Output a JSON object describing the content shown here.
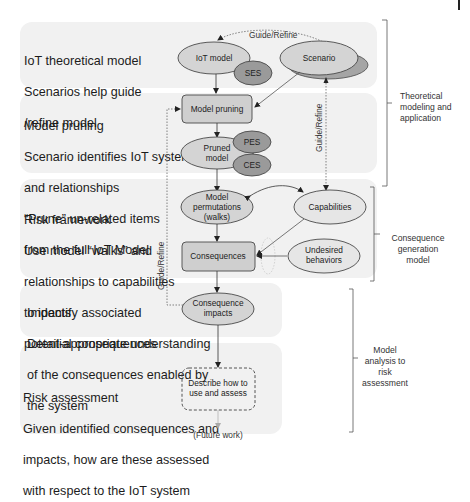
{
  "bands": [
    {
      "id": "theoretical",
      "lines": [
        "IoT theoretical model",
        "Scenarios help guide",
        "/refine model"
      ]
    },
    {
      "id": "pruning",
      "lines": [
        "Model pruning",
        "Scenario identifies IoT system",
        "and relationships",
        "“Prune” un-related items",
        "from the full IoT Model"
      ]
    },
    {
      "id": "risk-framework",
      "lines": [
        "Risk framework",
        "Use model “walks” and",
        "relationships to capabilities",
        "to identify associated",
        "potential consequences"
      ]
    },
    {
      "id": "impacts",
      "lines": [
        "Impacts",
        "Detail-appropriate understanding",
        "of the consequences enabled by",
        "the system"
      ]
    },
    {
      "id": "risk-assessment",
      "lines": [
        "Risk assessment",
        "Given identified consequences and",
        "impacts, how are these assessed",
        "with respect to the IoT system"
      ]
    }
  ],
  "nodes": {
    "iot_model": "IoT model",
    "ses": "SES",
    "scenario": "Scenario",
    "model_pruning": "Model pruning",
    "pruned_model": [
      "Pruned",
      "model"
    ],
    "pes": "PES",
    "ces": "CES",
    "model_permutations": [
      "Model",
      "permutations",
      "(walks)"
    ],
    "capabilities": "Capabilities",
    "consequences": "Consequences",
    "undesired_behaviors": [
      "Undesired",
      "behaviors"
    ],
    "consequence_impacts": [
      "Consequence",
      "impacts"
    ],
    "describe": [
      "Describe how to",
      "use and assess"
    ],
    "future_work": "(Future work)"
  },
  "edges": {
    "guide_refine_top": "Guide/Refine",
    "guide_refine_right": "Guide/Refine",
    "guide_refine_left": "Guide/Refine"
  },
  "brackets": {
    "theoretical": "Theoretical\nmodeling and\napplication",
    "consequence": "Consequence\ngeneration\nmodel",
    "analysis": "Model\nanalysis to\nrisk\nassessment"
  },
  "colors": {
    "band_bg": "#f1f1f1",
    "ellipse_light": "#d4d4d4",
    "ellipse_very_light": "#e6e6e6",
    "ellipse_dark": "#9a9a9a",
    "box_fill": "#cfcfcf",
    "stroke": "#4a4a4a"
  }
}
